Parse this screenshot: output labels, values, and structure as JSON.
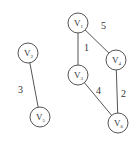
{
  "nodes": [
    {
      "id": "V1",
      "label": "V",
      "sub": "1",
      "x": 78,
      "y": 23
    },
    {
      "id": "V2",
      "label": "V",
      "sub": "2",
      "x": 28,
      "y": 53
    },
    {
      "id": "V3",
      "label": "V",
      "sub": "3",
      "x": 78,
      "y": 75
    },
    {
      "id": "V4",
      "label": "V",
      "sub": "4",
      "x": 116,
      "y": 60
    },
    {
      "id": "V5",
      "label": "V",
      "sub": "5",
      "x": 40,
      "y": 117
    },
    {
      "id": "V6",
      "label": "V",
      "sub": "6",
      "x": 118,
      "y": 123
    }
  ],
  "edges": [
    {
      "from": "V1",
      "to": "V3",
      "weight": "1",
      "lx": 84,
      "ly": 51
    },
    {
      "from": "V1",
      "to": "V4",
      "weight": "5",
      "lx": 101,
      "ly": 29
    },
    {
      "from": "V3",
      "to": "V6",
      "weight": "4",
      "lx": 96,
      "ly": 94
    },
    {
      "from": "V4",
      "to": "V6",
      "weight": "2",
      "lx": 121,
      "ly": 97
    },
    {
      "from": "V2",
      "to": "V5",
      "weight": "3",
      "lx": 18,
      "ly": 93
    }
  ]
}
